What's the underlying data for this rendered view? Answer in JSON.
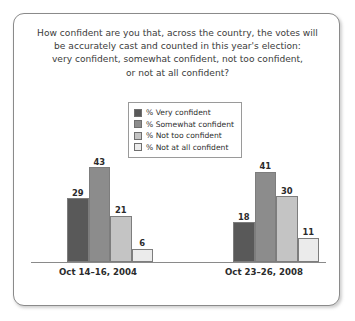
{
  "title": {
    "lines": [
      "How confident are you that, across the country, the votes will",
      "be accurately cast and counted in this year's election:",
      "very confident, somewhat confident, not too confident,",
      "or not at all confident?"
    ]
  },
  "legend": {
    "items": [
      {
        "label": "% Very confident",
        "color": "#595959"
      },
      {
        "label": "% Somewhat confident",
        "color": "#8c8c8c"
      },
      {
        "label": "% Not too confident",
        "color": "#c4c4c4"
      },
      {
        "label": "% Not at all confident",
        "color": "#ebebeb"
      }
    ]
  },
  "chart_data": {
    "type": "bar",
    "xlabel": "",
    "ylabel": "",
    "ylim": [
      0,
      50
    ],
    "grid": false,
    "legend_position": "top-center",
    "categories": [
      "Oct 14–16, 2004",
      "Oct 23–26, 2008"
    ],
    "series": [
      {
        "name": "% Very confident",
        "color": "#595959",
        "values": [
          29,
          18
        ]
      },
      {
        "name": "% Somewhat confident",
        "color": "#8c8c8c",
        "values": [
          43,
          41
        ]
      },
      {
        "name": "% Not too confident",
        "color": "#c4c4c4",
        "values": [
          21,
          30
        ]
      },
      {
        "name": "% Not at all confident",
        "color": "#ebebeb",
        "values": [
          6,
          11
        ]
      }
    ]
  }
}
